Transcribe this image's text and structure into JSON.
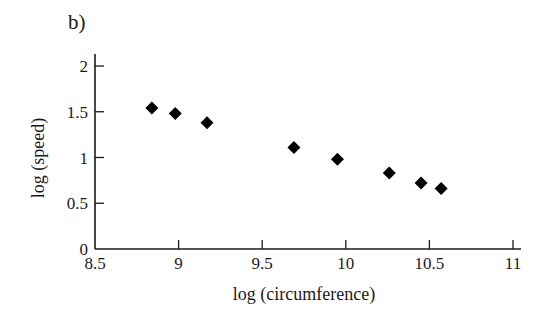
{
  "chart_data": {
    "type": "scatter",
    "panel_label": "b)",
    "title": "",
    "xlabel": "log (circumference)",
    "ylabel": "log (speed)",
    "xlim": [
      8.5,
      11
    ],
    "ylim": [
      0,
      2
    ],
    "x_ticks": [
      "8.5",
      "9",
      "9.5",
      "10",
      "10.5",
      "11"
    ],
    "x_tick_values": [
      8.5,
      9,
      9.5,
      10,
      10.5,
      11
    ],
    "y_ticks": [
      "0",
      "0.5",
      "1",
      "1.5",
      "2"
    ],
    "y_tick_values": [
      0,
      0.5,
      1,
      1.5,
      2
    ],
    "grid": false,
    "legend": null,
    "marker": "diamond",
    "marker_color": "#000000",
    "series": [
      {
        "name": "data",
        "x": [
          8.84,
          8.98,
          9.17,
          9.69,
          9.95,
          10.26,
          10.45,
          10.57
        ],
        "y": [
          1.54,
          1.48,
          1.38,
          1.11,
          0.98,
          0.83,
          0.72,
          0.66
        ]
      }
    ]
  }
}
